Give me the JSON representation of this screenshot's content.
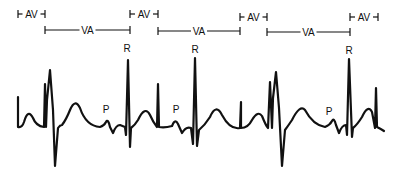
{
  "diagram": {
    "interval_labels": {
      "av": "AV",
      "va": "VA"
    },
    "wave_labels": {
      "p": "P",
      "r": "R"
    },
    "av_intervals": [
      {
        "label": "AV",
        "x1": 18,
        "x2": 45,
        "y": 14
      },
      {
        "label": "AV",
        "x1": 130,
        "x2": 158,
        "y": 14
      },
      {
        "label": "AV",
        "x1": 240,
        "x2": 267,
        "y": 17
      },
      {
        "label": "AV",
        "x1": 350,
        "x2": 378,
        "y": 17
      }
    ],
    "va_intervals": [
      {
        "label": "VA",
        "x1": 45,
        "x2": 130,
        "y": 30
      },
      {
        "label": "VA",
        "x1": 158,
        "x2": 240,
        "y": 31
      },
      {
        "label": "VA",
        "x1": 267,
        "x2": 350,
        "y": 32
      }
    ],
    "r_labels": [
      {
        "label": "R",
        "x": 127,
        "y": 52
      },
      {
        "label": "R",
        "x": 195,
        "y": 53
      },
      {
        "label": "R",
        "x": 349,
        "y": 54
      }
    ],
    "p_labels": [
      {
        "label": "P",
        "x": 106,
        "y": 113
      },
      {
        "label": "P",
        "x": 176,
        "y": 113
      },
      {
        "label": "P",
        "x": 329,
        "y": 115
      }
    ],
    "colors": {
      "trace": "#111111",
      "background": "#ffffff"
    }
  }
}
